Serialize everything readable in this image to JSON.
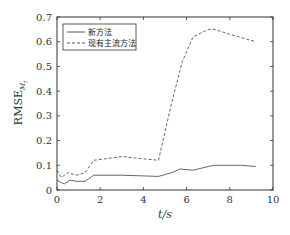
{
  "chart_data": {
    "type": "line",
    "title": "",
    "xlabel": "t/s",
    "ylabel": "RMSE_{M_t}",
    "ylabel_main": "RMSE",
    "ylabel_sub": "M",
    "ylabel_subsub": "t",
    "xlim": [
      0,
      10
    ],
    "ylim": [
      0,
      0.7
    ],
    "xticks": [
      0,
      2,
      4,
      6,
      8,
      10
    ],
    "yticks": [
      0,
      0.1,
      0.2,
      0.3,
      0.4,
      0.5,
      0.6,
      0.7
    ],
    "xtick_labels": [
      "0",
      "2",
      "4",
      "6",
      "8",
      "10"
    ],
    "ytick_labels": [
      "0",
      "0.1",
      "0.2",
      "0.3",
      "0.4",
      "0.5",
      "0.6",
      "0.7"
    ],
    "grid": false,
    "legend_position": "upper left",
    "series": [
      {
        "name": "新方法",
        "style": "solid",
        "color": "#555555",
        "x": [
          0,
          0.2,
          0.35,
          0.6,
          0.9,
          1.3,
          1.7,
          3.0,
          4.7,
          5.3,
          5.7,
          6.3,
          7.0,
          7.3,
          8.5,
          9.2
        ],
        "values": [
          0.04,
          0.03,
          0.025,
          0.04,
          0.035,
          0.035,
          0.06,
          0.06,
          0.055,
          0.07,
          0.085,
          0.08,
          0.095,
          0.1,
          0.1,
          0.095
        ]
      },
      {
        "name": "现有主流方法",
        "style": "dashed",
        "color": "#555555",
        "x": [
          0,
          0.2,
          0.5,
          0.9,
          1.3,
          1.7,
          3.0,
          4.7,
          5.3,
          5.8,
          6.3,
          7.0,
          7.3,
          8.0,
          9.2
        ],
        "values": [
          0.08,
          0.05,
          0.07,
          0.06,
          0.07,
          0.12,
          0.135,
          0.12,
          0.35,
          0.52,
          0.62,
          0.65,
          0.65,
          0.63,
          0.6
        ]
      }
    ]
  }
}
